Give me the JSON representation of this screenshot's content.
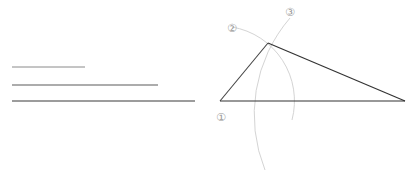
{
  "diagram": {
    "type": "geometry-construction",
    "given_segments": [
      {
        "id": "short",
        "x1": 12,
        "x2": 85,
        "y": 67,
        "color": "#8a8a8a"
      },
      {
        "id": "medium",
        "x1": 12,
        "x2": 158,
        "y": 85,
        "color": "#5a5a5a"
      },
      {
        "id": "long",
        "x1": 12,
        "x2": 195,
        "y": 101,
        "color": "#3a3a3a"
      }
    ],
    "triangle": {
      "vertices": {
        "A": {
          "x": 220,
          "y": 101
        },
        "B": {
          "x": 268,
          "y": 43
        },
        "C": {
          "x": 405,
          "y": 101
        }
      },
      "color": "#333333"
    },
    "arcs": [
      {
        "label": "②",
        "center": "A",
        "radius": 75,
        "color": "#d0d0d0"
      },
      {
        "label": "③",
        "center": "C",
        "radius": 148,
        "color": "#d0d0d0"
      }
    ],
    "labels": {
      "step1": "①",
      "step2": "②",
      "step3": "③"
    }
  }
}
